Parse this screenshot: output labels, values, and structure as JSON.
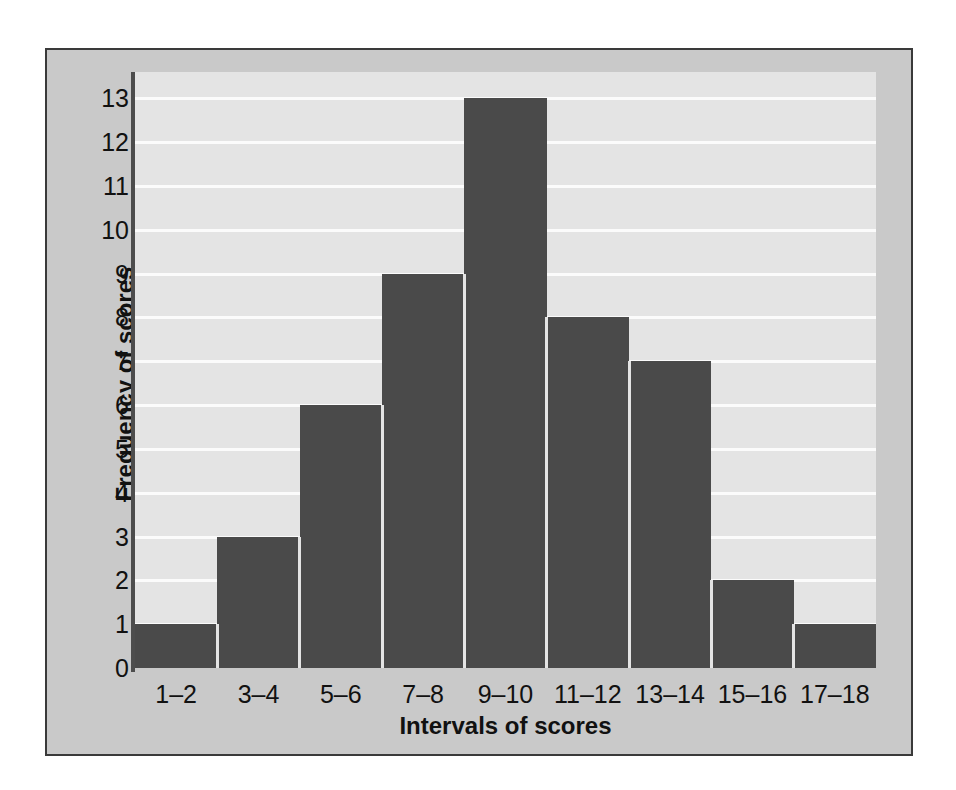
{
  "chart_data": {
    "type": "bar",
    "title": "",
    "xlabel": "Intervals of scores",
    "ylabel": "Frequency of scores",
    "categories": [
      "1–2",
      "3–4",
      "5–6",
      "7–8",
      "9–10",
      "11–12",
      "13–14",
      "15–16",
      "17–18"
    ],
    "values": [
      1,
      3,
      6,
      9,
      13,
      8,
      7,
      2,
      1
    ],
    "ylim": [
      0,
      13.6
    ],
    "y_ticks": [
      13,
      12,
      11,
      10,
      9,
      8,
      7,
      6,
      5,
      4,
      3,
      2,
      1,
      0
    ],
    "grid": true,
    "grid_axis": "y",
    "legend": null,
    "bar_color": "#4a4a4a",
    "plot_background": "#e4e4e4",
    "gridline_color": "#fbfbfb",
    "frame_background": "#c9c9c9",
    "axis_color": "#4d4d4d",
    "text_color": "#111111"
  }
}
